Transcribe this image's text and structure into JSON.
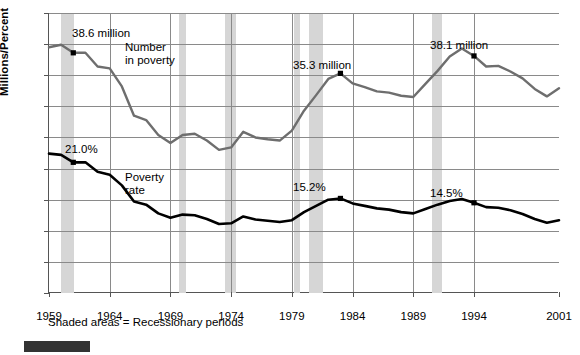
{
  "chart_data": {
    "type": "line",
    "title": "",
    "xlabel": "",
    "ylabel": "Millions/Percent",
    "xlim": [
      1959,
      2001
    ],
    "ylim": [
      0,
      45
    ],
    "grid": true,
    "legend_position": "inline-labels",
    "yticks": [
      0,
      5,
      10,
      15,
      20,
      25,
      30,
      35,
      40,
      45
    ],
    "xticks": [
      1959,
      1964,
      1969,
      1974,
      1979,
      1984,
      1989,
      1994,
      2001
    ],
    "x": [
      1959,
      1960,
      1961,
      1962,
      1963,
      1964,
      1965,
      1966,
      1967,
      1968,
      1969,
      1970,
      1971,
      1972,
      1973,
      1974,
      1975,
      1976,
      1977,
      1978,
      1979,
      1980,
      1981,
      1982,
      1983,
      1984,
      1985,
      1986,
      1987,
      1988,
      1989,
      1990,
      1991,
      1992,
      1993,
      1994,
      1995,
      1996,
      1997,
      1998,
      1999,
      2000,
      2001
    ],
    "series": [
      {
        "name": "Number in poverty",
        "units": "millions",
        "color": "#6e6e6e",
        "values": [
          39.5,
          39.9,
          38.6,
          38.6,
          36.4,
          36.1,
          33.2,
          28.5,
          27.8,
          25.4,
          24.1,
          25.4,
          25.6,
          24.5,
          23.0,
          23.4,
          25.9,
          25.0,
          24.7,
          24.5,
          26.1,
          29.3,
          31.8,
          34.4,
          35.3,
          33.7,
          33.1,
          32.4,
          32.2,
          31.7,
          31.5,
          33.6,
          35.7,
          38.0,
          39.3,
          38.1,
          36.4,
          36.5,
          35.6,
          34.5,
          32.8,
          31.6,
          32.9
        ]
      },
      {
        "name": "Poverty rate",
        "units": "percent",
        "color": "#000000",
        "values": [
          22.4,
          22.2,
          21.0,
          21.0,
          19.5,
          19.0,
          17.3,
          14.7,
          14.2,
          12.8,
          12.1,
          12.6,
          12.5,
          11.9,
          11.1,
          11.2,
          12.3,
          11.8,
          11.6,
          11.4,
          11.7,
          13.0,
          14.0,
          15.0,
          15.2,
          14.4,
          14.0,
          13.6,
          13.4,
          13.0,
          12.8,
          13.5,
          14.2,
          14.8,
          15.1,
          14.5,
          13.8,
          13.7,
          13.3,
          12.7,
          11.9,
          11.3,
          11.7
        ]
      }
    ],
    "annotations": [
      {
        "label": "38.6 million",
        "series": "Number in poverty",
        "x": 1961,
        "y": 38.6,
        "marker": true
      },
      {
        "label": "35.3 million",
        "series": "Number in poverty",
        "x": 1983,
        "y": 35.3,
        "marker": true
      },
      {
        "label": "38.1 million",
        "series": "Number in poverty",
        "x": 1994,
        "y": 38.1,
        "marker": true
      },
      {
        "label": "21.0%",
        "series": "Poverty rate",
        "x": 1961,
        "y": 21.0,
        "marker": true
      },
      {
        "label": "15.2%",
        "series": "Poverty rate",
        "x": 1983,
        "y": 15.2,
        "marker": true
      },
      {
        "label": "14.5%",
        "series": "Poverty rate",
        "x": 1994,
        "y": 14.5,
        "marker": true
      }
    ],
    "series_inline_labels": [
      {
        "text_line1": "Number",
        "text_line2": "in poverty"
      },
      {
        "text_line1": "Poverty",
        "text_line2": "rate"
      }
    ],
    "shaded_regions": {
      "label": "Recessionary periods",
      "color": "#d6d6d6",
      "periods": [
        {
          "start": 1960.0,
          "end": 1961.1
        },
        {
          "start": 1969.7,
          "end": 1970.3
        },
        {
          "start": 1973.5,
          "end": 1974.4
        },
        {
          "start": 1979.2,
          "end": 1979.7
        },
        {
          "start": 1980.4,
          "end": 1981.6
        },
        {
          "start": 1990.5,
          "end": 1991.4
        }
      ]
    }
  },
  "footnote": "Shaded areas = Recessionary periods",
  "bottom_bar": {
    "text": ""
  },
  "labels": {
    "ylabel": "Millions/Percent",
    "number_in_poverty_l1": "Number",
    "number_in_poverty_l2": "in poverty",
    "poverty_rate_l1": "Poverty",
    "poverty_rate_l2": "rate",
    "anno_386": "38.6 million",
    "anno_353": "35.3 million",
    "anno_381": "38.1 million",
    "anno_210": "21.0%",
    "anno_152": "15.2%",
    "anno_145": "14.5%",
    "y_0": "0",
    "y_5": "5",
    "y_10": "10",
    "y_15": "15",
    "y_20": "20",
    "y_25": "25",
    "y_30": "30",
    "y_35": "35",
    "y_40": "40",
    "y_45": "45",
    "x_1959": "1959",
    "x_1964": "1964",
    "x_1969": "1969",
    "x_1974": "1974",
    "x_1979": "1979",
    "x_1984": "1984",
    "x_1989": "1989",
    "x_1994": "1994",
    "x_2001": "2001"
  }
}
